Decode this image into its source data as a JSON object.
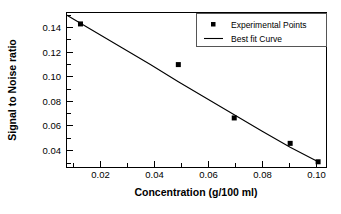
{
  "chart_data": {
    "type": "scatter",
    "title": "",
    "xlabel": "Concentration (g/100 ml)",
    "ylabel": "Signal to Noise ratio",
    "xlim": [
      0.01,
      0.103
    ],
    "ylim": [
      0.03,
      0.152
    ],
    "xticks": [
      0.02,
      0.04,
      0.06,
      0.08,
      0.1
    ],
    "yticks": [
      0.04,
      0.06,
      0.08,
      0.1,
      0.12,
      0.14
    ],
    "xtick_labels": [
      "0.02",
      "0.04",
      "0.06",
      "0.08",
      "0.10"
    ],
    "ytick_labels": [
      "0.04",
      "0.06",
      "0.08",
      "0.10",
      "0.12",
      "0.14"
    ],
    "minor_ticks": true,
    "grid": false,
    "legend_position": "top-right",
    "series": [
      {
        "name": "Experimental Points",
        "type": "scatter",
        "marker": "square",
        "color": "#000000",
        "x": [
          0.015,
          0.05,
          0.07,
          0.09,
          0.1
        ],
        "y": [
          0.143,
          0.111,
          0.069,
          0.049,
          0.0345
        ]
      },
      {
        "name": "Best fit Curve",
        "type": "line",
        "color": "#000000",
        "x": [
          0.01,
          0.02,
          0.03,
          0.04,
          0.05,
          0.06,
          0.07,
          0.08,
          0.09,
          0.1
        ],
        "y": [
          0.15,
          0.137,
          0.124,
          0.111,
          0.0975,
          0.0845,
          0.0715,
          0.0585,
          0.046,
          0.0345
        ]
      }
    ]
  },
  "axes": {
    "x_title": "Concentration (g/100 ml)",
    "y_title": "Signal to Noise ratio",
    "x_tick_labels": [
      "0.02",
      "0.04",
      "0.06",
      "0.08",
      "0.10"
    ],
    "y_tick_labels": [
      "0.04",
      "0.06",
      "0.08",
      "0.10",
      "0.12",
      "0.14"
    ]
  },
  "legend": {
    "items": [
      {
        "label": "Experimental Points",
        "marker": "square"
      },
      {
        "label": "Best fit Curve",
        "marker": "line"
      }
    ]
  },
  "colors": {
    "ink": "#000000",
    "background": "#ffffff",
    "legend_border": "#555555"
  }
}
